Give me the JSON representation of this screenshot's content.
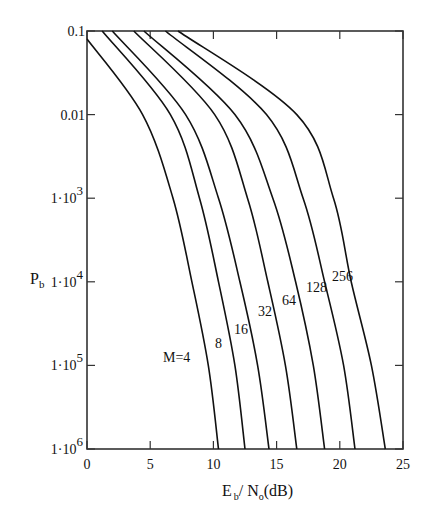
{
  "chart_data": {
    "type": "line",
    "title": "",
    "xlabel": "E_b / N_o (dB)",
    "ylabel": "P_b",
    "xlim": [
      0,
      25
    ],
    "ylim": [
      1e-06,
      0.1
    ],
    "yscale": "log",
    "grid": false,
    "x_ticks": [
      0,
      5,
      10,
      15,
      20,
      25
    ],
    "x_tick_labels": [
      "0",
      "5",
      "10",
      "15",
      "20",
      "25"
    ],
    "y_ticks": [
      0.1,
      0.01,
      0.001,
      0.0001,
      1e-05,
      1e-06
    ],
    "y_tick_labels": [
      "0.1",
      "0.01",
      "1·10⁻³",
      "1·10⁻⁴",
      "1·10⁻⁵",
      "1·10⁻⁶"
    ],
    "series": [
      {
        "name": "M=4",
        "label": "M=4",
        "x": [
          0,
          4.4,
          6.8,
          8.3,
          9.6,
          10.4
        ],
        "y": [
          0.08,
          0.01,
          0.001,
          0.0001,
          1e-05,
          1e-06
        ]
      },
      {
        "name": "M=8",
        "label": "8",
        "x": [
          1.2,
          6.6,
          8.9,
          10.4,
          11.7,
          12.5
        ],
        "y": [
          0.1,
          0.01,
          0.001,
          0.0001,
          1e-05,
          1e-06
        ]
      },
      {
        "name": "M=16",
        "label": "16",
        "x": [
          2.0,
          7.8,
          10.4,
          12.1,
          13.5,
          14.4
        ],
        "y": [
          0.1,
          0.01,
          0.001,
          0.0001,
          1e-05,
          1e-06
        ]
      },
      {
        "name": "M=32",
        "label": "32",
        "x": [
          3.7,
          10.1,
          12.7,
          14.3,
          15.7,
          16.6
        ],
        "y": [
          0.1,
          0.01,
          0.001,
          0.0001,
          1e-05,
          1e-06
        ]
      },
      {
        "name": "M=64",
        "label": "64",
        "x": [
          4.5,
          11.7,
          14.7,
          16.5,
          17.9,
          18.8
        ],
        "y": [
          0.1,
          0.01,
          0.001,
          0.0001,
          1e-05,
          1e-06
        ]
      },
      {
        "name": "M=128",
        "label": "128",
        "x": [
          6.2,
          14.2,
          17.1,
          18.8,
          20.3,
          21.2
        ],
        "y": [
          0.1,
          0.01,
          0.001,
          0.0001,
          1e-05,
          1e-06
        ]
      },
      {
        "name": "M=256",
        "label": "256",
        "x": [
          7.2,
          16.6,
          19.5,
          20.9,
          22.5,
          23.6
        ],
        "y": [
          0.1,
          0.01,
          0.001,
          0.0001,
          1e-05,
          1e-06
        ]
      }
    ],
    "annotations": [
      {
        "text": "M=4",
        "x_px": 163,
        "y_px": 362
      },
      {
        "text": "8",
        "x_px": 215,
        "y_px": 348
      },
      {
        "text": "16",
        "x_px": 234,
        "y_px": 334
      },
      {
        "text": "32",
        "x_px": 258,
        "y_px": 316
      },
      {
        "text": "64",
        "x_px": 282,
        "y_px": 305
      },
      {
        "text": "128",
        "x_px": 306,
        "y_px": 292
      },
      {
        "text": "256",
        "x_px": 332,
        "y_px": 281
      }
    ],
    "legend": "none (inline curve labels)"
  },
  "axes": {
    "ylabel_main": "P",
    "ylabel_sub": "b",
    "xlabel_E": "E",
    "xlabel_E_sub": "b",
    "xlabel_slash": "/ N",
    "xlabel_N_sub": "o",
    "xlabel_unit": "(dB)"
  },
  "style": {
    "line_color": "#111111",
    "axis_color": "#333333",
    "background": "#ffffff"
  }
}
